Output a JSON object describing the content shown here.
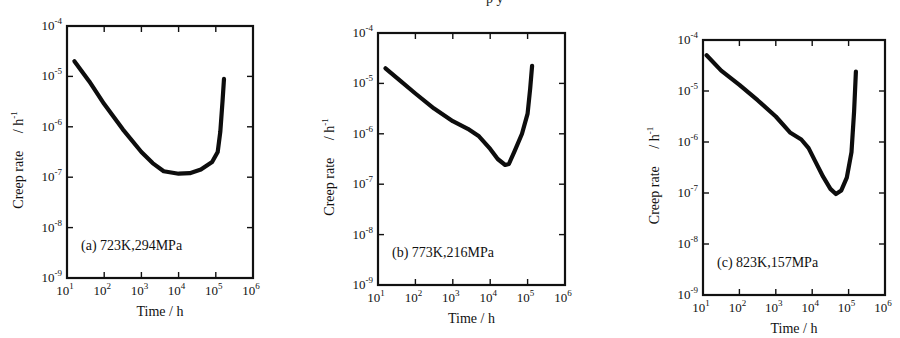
{
  "figure": {
    "top_fragment": "p                         y"
  },
  "chart_data": [
    {
      "type": "line",
      "panel": "a",
      "annotation": "(a) 723K,294MPa",
      "xlabel": "Time / h",
      "ylabel": "Creep rate  / h-1",
      "xscale": "log",
      "yscale": "log",
      "xlim": [
        10,
        1000000
      ],
      "ylim": [
        1e-09,
        0.0001
      ],
      "x_ticks": [
        "10^1",
        "10^2",
        "10^3",
        "10^4",
        "10^5",
        "10^6"
      ],
      "y_ticks": [
        "10^-9",
        "10^-8",
        "10^-7",
        "10^-6",
        "10^-5",
        "10^-4"
      ],
      "grid": false,
      "frame": {
        "x0": 67,
        "y0": 26,
        "x1": 253,
        "y1": 278
      },
      "series": [
        {
          "name": "723K,294MPa",
          "log_x": [
            1.2,
            1.6,
            2.0,
            2.5,
            3.0,
            3.3,
            3.6,
            4.0,
            4.3,
            4.6,
            4.9,
            5.05,
            5.12,
            5.18,
            5.22
          ],
          "log_y": [
            -4.7,
            -5.1,
            -5.55,
            -6.05,
            -6.5,
            -6.72,
            -6.88,
            -6.93,
            -6.92,
            -6.85,
            -6.7,
            -6.5,
            -6.1,
            -5.5,
            -5.05
          ]
        }
      ]
    },
    {
      "type": "line",
      "panel": "b",
      "annotation": "(b) 773K,216MPa",
      "xlabel": "Time / h",
      "ylabel": "Creep rate  / h-1",
      "xscale": "log",
      "yscale": "log",
      "xlim": [
        10,
        1000000
      ],
      "ylim": [
        1e-09,
        0.0001
      ],
      "x_ticks": [
        "10^1",
        "10^2",
        "10^3",
        "10^4",
        "10^5",
        "10^6"
      ],
      "y_ticks": [
        "10^-9",
        "10^-8",
        "10^-7",
        "10^-6",
        "10^-5",
        "10^-4"
      ],
      "grid": false,
      "frame": {
        "x0": 378,
        "y0": 33,
        "x1": 565,
        "y1": 285
      },
      "series": [
        {
          "name": "773K,216MPa",
          "log_x": [
            1.2,
            1.6,
            2.0,
            2.5,
            3.0,
            3.4,
            3.7,
            4.0,
            4.2,
            4.4,
            4.5,
            4.65,
            4.85,
            5.0,
            5.07,
            5.12
          ],
          "log_y": [
            -4.7,
            -4.95,
            -5.2,
            -5.5,
            -5.75,
            -5.9,
            -6.05,
            -6.3,
            -6.5,
            -6.62,
            -6.6,
            -6.35,
            -6.0,
            -5.6,
            -5.1,
            -4.65
          ]
        }
      ]
    },
    {
      "type": "line",
      "panel": "c",
      "annotation": "(c) 823K,157MPa",
      "xlabel": "Time / h",
      "ylabel": "Creep rate  / h-1",
      "xscale": "log",
      "yscale": "log",
      "xlim": [
        10,
        1000000
      ],
      "ylim": [
        1e-09,
        0.0001
      ],
      "x_ticks": [
        "10^1",
        "10^2",
        "10^3",
        "10^4",
        "10^5",
        "10^6"
      ],
      "y_ticks": [
        "10^-9",
        "10^-8",
        "10^-7",
        "10^-6",
        "10^-5",
        "10^-4"
      ],
      "grid": false,
      "frame": {
        "x0": 703,
        "y0": 40,
        "x1": 885,
        "y1": 295
      },
      "series": [
        {
          "name": "823K,157MPa",
          "log_x": [
            1.1,
            1.5,
            2.0,
            2.5,
            3.0,
            3.4,
            3.7,
            3.9,
            4.1,
            4.3,
            4.5,
            4.65,
            4.8,
            4.95,
            5.08,
            5.15,
            5.2
          ],
          "log_y": [
            -4.3,
            -4.6,
            -4.88,
            -5.18,
            -5.5,
            -5.82,
            -5.95,
            -6.12,
            -6.4,
            -6.68,
            -6.92,
            -7.02,
            -6.95,
            -6.7,
            -6.2,
            -5.4,
            -4.62
          ]
        }
      ]
    }
  ]
}
